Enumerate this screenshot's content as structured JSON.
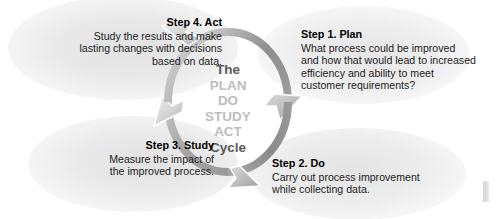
{
  "diagram": {
    "center": {
      "lead": "The",
      "words": [
        "PLAN",
        "DO",
        "STUDY",
        "ACT"
      ],
      "tail": "Cycle"
    },
    "steps": [
      {
        "id": "act",
        "title": "Step 4. Act",
        "body": "Study the results and make\nlasting changes with decisions\nbased on data."
      },
      {
        "id": "plan",
        "title": "Step 1. Plan",
        "body": "What process could be improved\nand how that would lead to increased\nefficiency and ability to meet\ncustomer requirements?"
      },
      {
        "id": "study",
        "title": "Step 3. Study",
        "body": "Measure the impact of\nthe improved process."
      },
      {
        "id": "do",
        "title": "Step 2. Do",
        "body": "Carry out process improvement\nwhile collecting data."
      }
    ],
    "colors": {
      "ring_dark": "#8f8f8f",
      "ring_light": "#cfcfcf",
      "center_lead_text": "#5a5a5a",
      "center_word_text": "#bdbdbd",
      "step_text": "#1c1c1c",
      "background": "#ffffff"
    }
  }
}
